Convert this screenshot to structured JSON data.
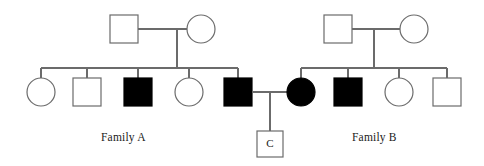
{
  "diagram": {
    "type": "pedigree-chart",
    "title": "",
    "width": 484,
    "height": 166,
    "background_color": "#ffffff",
    "line_color": "#6b6b6b",
    "affected_fill": "#000000",
    "unaffected_fill": "#ffffff",
    "legend_note": "filled = affected, open = unaffected; square = male, circle = female"
  },
  "labels": {
    "family_a": "Family A",
    "family_b": "Family B",
    "child_c": "C"
  },
  "families": [
    {
      "id": "family-a",
      "label": "Family A",
      "generation_i": [
        {
          "id": "a-i-1",
          "shape": "square",
          "sex": "male",
          "affected": false,
          "x": 110,
          "y": 15,
          "size": 28
        },
        {
          "id": "a-i-2",
          "shape": "circle",
          "sex": "female",
          "affected": false,
          "x": 187,
          "y": 15,
          "size": 28
        }
      ],
      "generation_ii": [
        {
          "id": "a-ii-1",
          "shape": "circle",
          "sex": "female",
          "affected": false,
          "x": 27,
          "y": 78,
          "size": 28
        },
        {
          "id": "a-ii-2",
          "shape": "square",
          "sex": "male",
          "affected": false,
          "x": 73,
          "y": 78,
          "size": 28
        },
        {
          "id": "a-ii-3",
          "shape": "square",
          "sex": "male",
          "affected": true,
          "x": 124,
          "y": 78,
          "size": 28
        },
        {
          "id": "a-ii-4",
          "shape": "circle",
          "sex": "female",
          "affected": false,
          "x": 175,
          "y": 78,
          "size": 28
        },
        {
          "id": "a-ii-5",
          "shape": "square",
          "sex": "male",
          "affected": true,
          "x": 224,
          "y": 78,
          "size": 28
        }
      ]
    },
    {
      "id": "family-b",
      "label": "Family B",
      "generation_i": [
        {
          "id": "b-i-1",
          "shape": "square",
          "sex": "male",
          "affected": false,
          "x": 324,
          "y": 15,
          "size": 28
        },
        {
          "id": "b-i-2",
          "shape": "circle",
          "sex": "female",
          "affected": false,
          "x": 400,
          "y": 15,
          "size": 28
        }
      ],
      "generation_ii": [
        {
          "id": "b-ii-1",
          "shape": "circle",
          "sex": "female",
          "affected": true,
          "x": 287,
          "y": 78,
          "size": 28
        },
        {
          "id": "b-ii-2",
          "shape": "square",
          "sex": "male",
          "affected": true,
          "x": 334,
          "y": 78,
          "size": 28
        },
        {
          "id": "b-ii-3",
          "shape": "circle",
          "sex": "female",
          "affected": false,
          "x": 385,
          "y": 78,
          "size": 28
        },
        {
          "id": "b-ii-4",
          "shape": "square",
          "sex": "male",
          "affected": false,
          "x": 433,
          "y": 78,
          "size": 28
        }
      ]
    }
  ],
  "generation_iii": [
    {
      "id": "c-iii-1",
      "shape": "square",
      "sex": "male",
      "affected": false,
      "label": "C",
      "x": 257,
      "y": 131,
      "size": 26
    }
  ],
  "matings": [
    {
      "id": "mating-a-i",
      "partners": [
        "a-i-1",
        "a-i-2"
      ],
      "y": 29,
      "x1": 138,
      "x2": 187,
      "descent_x": 177
    },
    {
      "id": "mating-b-i",
      "partners": [
        "b-i-1",
        "b-i-2"
      ],
      "y": 29,
      "x1": 352,
      "x2": 400,
      "descent_x": 374
    },
    {
      "id": "mating-central",
      "partners": [
        "a-ii-5",
        "b-ii-1"
      ],
      "y": 92,
      "x1": 252,
      "x2": 287,
      "descent_x": 270
    }
  ],
  "siblines": [
    {
      "id": "sibline-family-a",
      "y": 68,
      "x1": 41,
      "x2": 238,
      "children": [
        "a-ii-1",
        "a-ii-2",
        "a-ii-3",
        "a-ii-4",
        "a-ii-5"
      ]
    },
    {
      "id": "sibline-family-b",
      "y": 68,
      "x1": 301,
      "x2": 447,
      "children": [
        "b-ii-1",
        "b-ii-2",
        "b-ii-3",
        "b-ii-4"
      ]
    }
  ]
}
